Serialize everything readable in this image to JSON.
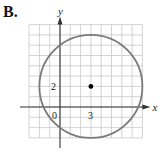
{
  "panel_label": "B.",
  "chart_data": {
    "type": "scatter",
    "title": "",
    "xlabel": "x",
    "ylabel": "y",
    "xlim": [
      -3,
      8
    ],
    "ylim": [
      -3,
      8
    ],
    "grid": true,
    "grid_step": 1,
    "tick_labels": {
      "origin": "0",
      "x": [
        "3"
      ],
      "y": [
        "2"
      ]
    },
    "shapes": [
      {
        "type": "circle",
        "center": [
          3,
          2
        ],
        "radius": 5,
        "stroke": "#7a7a7a"
      }
    ],
    "points": [
      {
        "x": 3,
        "y": 2,
        "label": "center",
        "color": "#000000"
      }
    ],
    "equation": "(x - 3)^2 + (y - 2)^2 = 25"
  },
  "colors": {
    "grid": "#c8c8c8",
    "axis": "#333333",
    "circle": "#7a7a7a",
    "point": "#000000"
  }
}
